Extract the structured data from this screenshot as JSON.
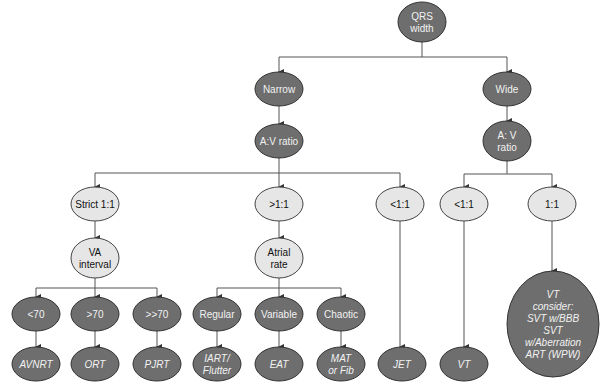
{
  "diagram": {
    "colors": {
      "dark_node": "#6e6e6e",
      "light_node": "#e6e6e6",
      "edge": "#555555"
    },
    "nodes": [
      {
        "id": "qrs",
        "lines": [
          "QRS",
          "width"
        ],
        "style": "dark"
      },
      {
        "id": "narrow",
        "lines": [
          "Narrow"
        ],
        "style": "dark"
      },
      {
        "id": "wide",
        "lines": [
          "Wide"
        ],
        "style": "dark"
      },
      {
        "id": "av_left",
        "lines": [
          "A:V ratio"
        ],
        "style": "dark"
      },
      {
        "id": "av_right",
        "lines": [
          "A: V",
          "ratio"
        ],
        "style": "dark"
      },
      {
        "id": "strict",
        "lines": [
          "Strict 1:1"
        ],
        "style": "light"
      },
      {
        "id": "gt11",
        "lines": [
          ">1:1"
        ],
        "style": "light"
      },
      {
        "id": "lt11_jet",
        "lines": [
          "<1:1"
        ],
        "style": "light"
      },
      {
        "id": "lt11_vt",
        "lines": [
          "<1:1"
        ],
        "style": "light"
      },
      {
        "id": "eq11",
        "lines": [
          "1:1"
        ],
        "style": "light"
      },
      {
        "id": "va",
        "lines": [
          "VA",
          "interval"
        ],
        "style": "light"
      },
      {
        "id": "atrial",
        "lines": [
          "Atrial",
          "rate"
        ],
        "style": "light"
      },
      {
        "id": "lt70",
        "lines": [
          "<70"
        ],
        "style": "dark"
      },
      {
        "id": "gt70",
        "lines": [
          ">70"
        ],
        "style": "dark"
      },
      {
        "id": "ggt70",
        "lines": [
          ">>70"
        ],
        "style": "dark"
      },
      {
        "id": "regular",
        "lines": [
          "Regular"
        ],
        "style": "dark"
      },
      {
        "id": "variable",
        "lines": [
          "Variable"
        ],
        "style": "dark"
      },
      {
        "id": "chaotic",
        "lines": [
          "Chaotic"
        ],
        "style": "dark"
      },
      {
        "id": "avnrt",
        "lines": [
          "AVNRT"
        ],
        "style": "dark",
        "italic": true
      },
      {
        "id": "ort",
        "lines": [
          "ORT"
        ],
        "style": "dark",
        "italic": true
      },
      {
        "id": "pjrt",
        "lines": [
          "PJRT"
        ],
        "style": "dark",
        "italic": true
      },
      {
        "id": "iart",
        "lines": [
          "IART/",
          "Flutter"
        ],
        "style": "dark",
        "italic": true
      },
      {
        "id": "eat",
        "lines": [
          "EAT"
        ],
        "style": "dark",
        "italic": true
      },
      {
        "id": "mat",
        "lines": [
          "MAT",
          "or Fib"
        ],
        "style": "dark",
        "italic": true
      },
      {
        "id": "jet",
        "lines": [
          "JET"
        ],
        "style": "dark",
        "italic": true
      },
      {
        "id": "vt",
        "lines": [
          "VT"
        ],
        "style": "dark",
        "italic": true
      },
      {
        "id": "vt_consider",
        "lines": [
          "VT",
          "consider:",
          "SVT w/BBB",
          "SVT",
          "w/Aberration",
          "ART (WPW)"
        ],
        "style": "dark",
        "italic": true
      }
    ],
    "edges": [
      [
        "qrs",
        "narrow"
      ],
      [
        "qrs",
        "wide"
      ],
      [
        "narrow",
        "av_left"
      ],
      [
        "wide",
        "av_right"
      ],
      [
        "av_left",
        "strict"
      ],
      [
        "av_left",
        "gt11"
      ],
      [
        "av_left",
        "lt11_jet"
      ],
      [
        "av_right",
        "lt11_vt"
      ],
      [
        "av_right",
        "eq11"
      ],
      [
        "strict",
        "va"
      ],
      [
        "gt11",
        "atrial"
      ],
      [
        "va",
        "lt70"
      ],
      [
        "va",
        "gt70"
      ],
      [
        "va",
        "ggt70"
      ],
      [
        "atrial",
        "regular"
      ],
      [
        "atrial",
        "variable"
      ],
      [
        "atrial",
        "chaotic"
      ],
      [
        "lt70",
        "avnrt"
      ],
      [
        "gt70",
        "ort"
      ],
      [
        "ggt70",
        "pjrt"
      ],
      [
        "regular",
        "iart"
      ],
      [
        "variable",
        "eat"
      ],
      [
        "chaotic",
        "mat"
      ],
      [
        "lt11_jet",
        "jet"
      ],
      [
        "lt11_vt",
        "vt"
      ],
      [
        "eq11",
        "vt_consider"
      ]
    ]
  }
}
